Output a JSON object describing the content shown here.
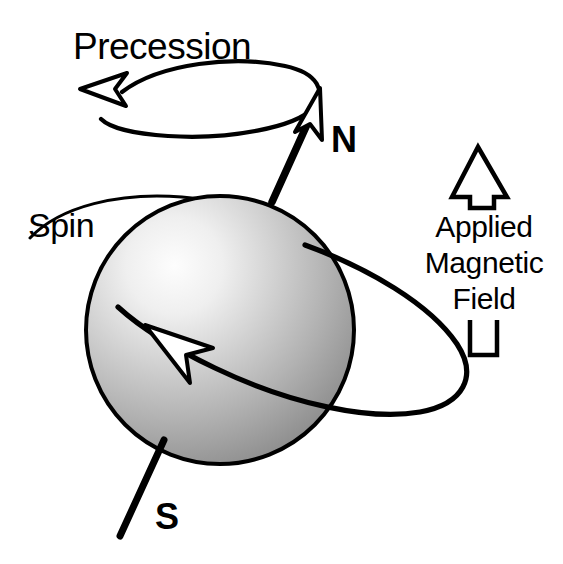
{
  "diagram": {
    "background_color": "#ffffff",
    "stroke_color": "#000000",
    "labels": {
      "precession": "Precession",
      "spin": "Spin",
      "north_pole": "N",
      "south_pole": "S",
      "field_line_1": "Applied",
      "field_line_2": "Magnetic",
      "field_line_3": "Field"
    },
    "elements": {
      "precession_ellipse": {
        "name": "precession-orbit-ellipse",
        "description": "open horizontal ellipse at top showing precession path",
        "direction": "counterclockwise",
        "arrow_points": "left"
      },
      "spin_ellipse": {
        "name": "spin-orbit-ellipse",
        "description": "tilted ellipse around the sphere showing spin rotation",
        "arrow_points": "up-left"
      },
      "sphere": {
        "name": "nucleus-sphere",
        "fill_light": "#fbfbfb",
        "fill_mid": "#b9b9b9",
        "fill_dark": "#8d8d8d",
        "center_x": 220,
        "center_y": 330,
        "radius": 135
      },
      "spin_axis": {
        "name": "magnetic-moment-axis",
        "north_tip_x": 318,
        "north_tip_y": 92,
        "south_tip_x": 120,
        "south_tip_y": 536
      },
      "applied_field_arrow": {
        "name": "applied-magnetic-field-arrow",
        "direction": "up",
        "fill": "#ffffff"
      }
    }
  }
}
